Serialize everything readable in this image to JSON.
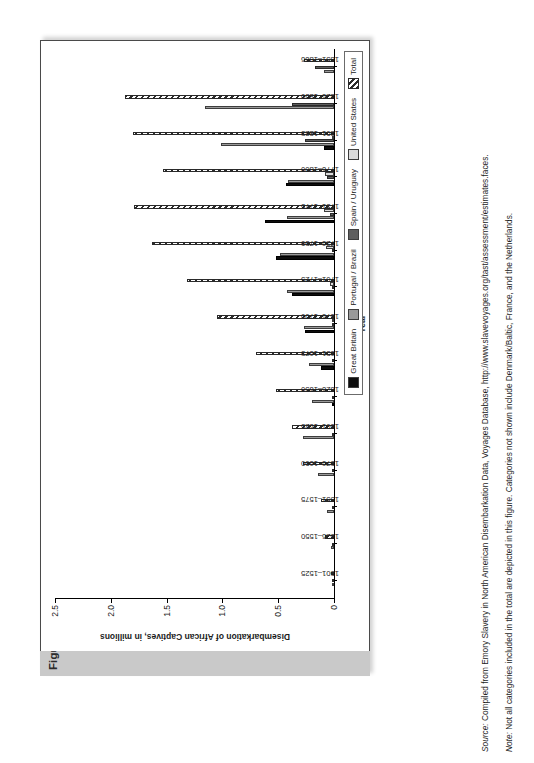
{
  "figure": {
    "number": "Figure 3.1",
    "title": "Select Disembarkation of African Captives in the West, 1501–1866"
  },
  "footnotes": {
    "source_label": "Source:",
    "source_text": " Compiled from Emory Slavery in North American Disembarkation Data, Voyages Database, http://www.slavevoyages.org/tast/assessment/estimates.faces.",
    "note_label": "Note:",
    "note_text": " Not all categories included in the total are depicted in this figure. Categories not shown include Denmark/Baltic, France, and the Netherlands."
  },
  "legend": {
    "items": [
      {
        "label": "Great Britain",
        "key": "great_britain",
        "color": "#0d0d0d",
        "pattern": "solid"
      },
      {
        "label": "Portugal / Brazil",
        "key": "portugal_brazil",
        "color": "#9a9a9a",
        "pattern": "solid"
      },
      {
        "label": "Spain / Uruguay",
        "key": "spain_uruguay",
        "color": "#5e5e5e",
        "pattern": "solid"
      },
      {
        "label": "United States",
        "key": "united_states",
        "color": "#dcdcdc",
        "pattern": "solid"
      },
      {
        "label": "Total",
        "key": "total",
        "color": "#2b2b2b",
        "pattern": "hatch"
      }
    ]
  },
  "chart_data": {
    "type": "bar",
    "orientation": "vertical-grouped",
    "title": "Select Disembarkation of African Captives in the West, 1501–1866",
    "xlabel": "Year",
    "ylabel": "Disembarkation of African Captives, in millions",
    "ylim": [
      0,
      2.5
    ],
    "yticks": [
      0,
      0.5,
      1.0,
      1.5,
      2.0,
      2.5
    ],
    "ytick_labels": [
      "0",
      "0.5",
      "1.0",
      "1.5",
      "2.0",
      "2.5"
    ],
    "grid": false,
    "legend_position": "right",
    "categories": [
      "1501–1525",
      "1526–1550",
      "1551–1575",
      "1576–1600",
      "1601–1625",
      "1626–1650",
      "1651–1675",
      "1676–1700",
      "1701–1725",
      "1726–1750",
      "1751–1775",
      "1776–1800",
      "1801–1825",
      "1826–1850",
      "1851–1866"
    ],
    "series": [
      {
        "name": "Great Britain",
        "values": [
          0,
          0,
          0,
          0,
          0,
          0.01,
          0.12,
          0.26,
          0.38,
          0.52,
          0.62,
          0.43,
          0.09,
          0,
          0
        ]
      },
      {
        "name": "Portugal / Brazil",
        "values": [
          0.01,
          0.03,
          0.06,
          0.14,
          0.28,
          0.2,
          0.22,
          0.27,
          0.42,
          0.48,
          0.42,
          0.41,
          1.01,
          1.16,
          0.09
        ]
      },
      {
        "name": "Spain / Uruguay",
        "values": [
          0.02,
          0.02,
          0.01,
          0.02,
          0.01,
          0.01,
          0.02,
          0.01,
          0.02,
          0.02,
          0.04,
          0.06,
          0.26,
          0.38,
          0.17
        ]
      },
      {
        "name": "United States",
        "values": [
          0,
          0,
          0,
          0,
          0,
          0,
          0,
          0.01,
          0.04,
          0.07,
          0.09,
          0.08,
          0.02,
          0,
          0
        ]
      },
      {
        "name": "Total",
        "values": [
          0.03,
          0.08,
          0.12,
          0.28,
          0.38,
          0.52,
          0.7,
          1.05,
          1.32,
          1.63,
          1.79,
          1.53,
          1.8,
          1.87,
          0.27
        ]
      }
    ]
  }
}
